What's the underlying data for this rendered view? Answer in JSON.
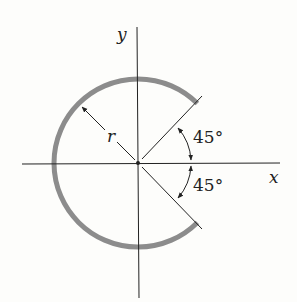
{
  "diagram": {
    "axis_x_label": "x",
    "axis_y_label": "y",
    "radius_label": "r",
    "angle_upper": "45°",
    "angle_lower": "45°",
    "colors": {
      "arc": "#8c8c8c",
      "lines": "#222222",
      "background": "#fdfdfb"
    }
  }
}
